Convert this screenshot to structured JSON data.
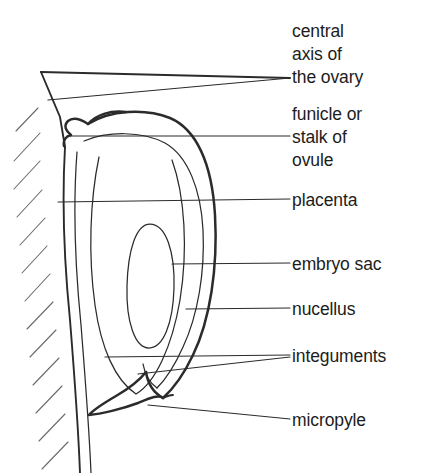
{
  "figure": {
    "ink_color": "#2b2b2b",
    "hatch_color": "#6a6a6a",
    "text_color": "#1c1c1c",
    "background": "#ffffff"
  },
  "labels": [
    {
      "id": "central-axis",
      "line1": "central",
      "line2": "axis of",
      "line3": "the ovary"
    },
    {
      "id": "funicle",
      "line1": "funicle or",
      "line2": "stalk of",
      "line3": "ovule"
    },
    {
      "id": "placenta",
      "line1": "placenta"
    },
    {
      "id": "embryo-sac",
      "line1": "embryo sac"
    },
    {
      "id": "nucellus",
      "line1": "nucellus"
    },
    {
      "id": "integuments",
      "line1": "integuments"
    },
    {
      "id": "micropyle",
      "line1": "micropyle"
    }
  ]
}
